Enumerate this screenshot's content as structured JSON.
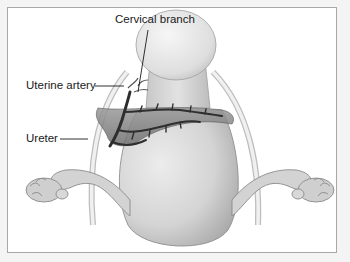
{
  "diagram": {
    "type": "anatomical illustration",
    "labels": [
      {
        "id": "cervical_branch",
        "text": "Cervical branch"
      },
      {
        "id": "uterine_artery",
        "text": "Uterine artery"
      },
      {
        "id": "ureter",
        "text": "Ureter"
      }
    ],
    "colors": {
      "background": "#f4f4f4",
      "frame_fill": "#ffffff",
      "frame_border": "#a8a8a8",
      "organ_fill": "#d9d9d9",
      "organ_shadow": "#a9a9a9",
      "vessel": "#3a3a3a",
      "ligament": "#9a9a9a",
      "label_text": "#1a1a1a"
    }
  }
}
